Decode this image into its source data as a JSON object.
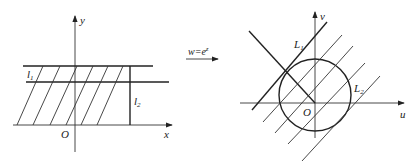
{
  "left_plane": {
    "axis_x_label": "x",
    "axis_y_label": "y",
    "origin_label": "O",
    "line1_label": "l",
    "line1_sub": "1",
    "line2_label": "l",
    "line2_sub": "2",
    "hatch_lines": [
      {
        "x1": 17,
        "y1": 125,
        "x2": 43,
        "y2": 66
      },
      {
        "x1": 33,
        "y1": 125,
        "x2": 60,
        "y2": 66
      },
      {
        "x1": 50,
        "y1": 125,
        "x2": 77,
        "y2": 66
      },
      {
        "x1": 66,
        "y1": 125,
        "x2": 93,
        "y2": 66
      },
      {
        "x1": 81,
        "y1": 125,
        "x2": 108,
        "y2": 66
      },
      {
        "x1": 97,
        "y1": 125,
        "x2": 123,
        "y2": 66
      }
    ]
  },
  "mapping": {
    "label_prefix": "w=e",
    "label_sup": "z"
  },
  "right_plane": {
    "axis_u_label": "u",
    "axis_v_label": "v",
    "origin_label": "O",
    "line1_label": "L",
    "line1_sub": "1",
    "line2_label": "L",
    "line2_sub": "2",
    "circle": {
      "cx": 315,
      "cy": 95,
      "r": 36
    },
    "hatch_lines": [
      {
        "x1": 263,
        "y1": 122,
        "x2": 342,
        "y2": 35
      },
      {
        "x1": 275,
        "y1": 133,
        "x2": 353,
        "y2": 46
      },
      {
        "x1": 288,
        "y1": 144,
        "x2": 365,
        "y2": 63
      },
      {
        "x1": 302,
        "y1": 161,
        "x2": 380,
        "y2": 76
      }
    ]
  }
}
